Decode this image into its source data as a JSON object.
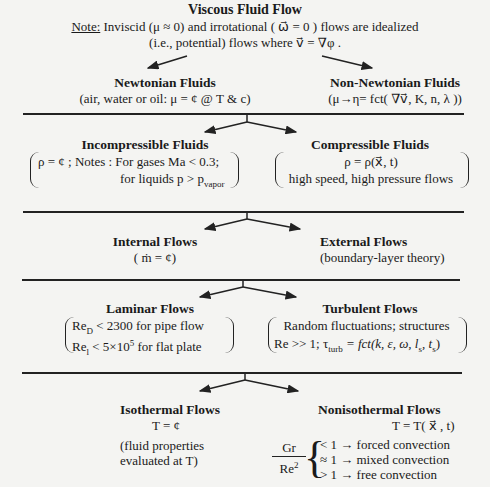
{
  "root": {
    "title": "Viscous Fluid Flow",
    "note_label": "Note:",
    "note_line1": " Inviscid (μ ≈ 0) and irrotational ( ω⃗ = 0 ) flows are idealized",
    "note_line2": "(i.e., potential) flows where  v⃗ = ∇φ ."
  },
  "level1": {
    "left": {
      "title": "Newtonian Fluids",
      "desc": "(air, water or oil: μ = ¢ @ T & c)"
    },
    "right": {
      "title": "Non-Newtonian Fluids",
      "desc": "(μ→η= fct( ∇v⃗, K, n, λ ))"
    }
  },
  "level2": {
    "left": {
      "title": "Incompressible Fluids",
      "line1": "ρ = ¢ ; Notes : For gases Ma < 0.3;",
      "line2_pre": "for liquids p > p",
      "line2_sub": "vapor"
    },
    "right": {
      "title": "Compressible Fluids",
      "line1": "ρ = ρ(x⃗, t)",
      "line2": "high speed, high pressure flows"
    }
  },
  "level3": {
    "left": {
      "title": "Internal Flows",
      "desc": "( ṁ = ¢)"
    },
    "right": {
      "title": "External Flows",
      "desc": "(boundary-layer theory)"
    }
  },
  "level4": {
    "left": {
      "title": "Laminar Flows",
      "line1_pre": "Re",
      "line1_sub": "D",
      "line1_post": " < 2300  for pipe flow",
      "line2_pre": "Re",
      "line2_sub": "l",
      "line2_mid": " < 5×10",
      "line2_sup": "5",
      "line2_post": "  for flat plate"
    },
    "right": {
      "title": "Turbulent Flows",
      "line1": "Random fluctuations; structures",
      "line2_pre": "Re >> 1; τ",
      "line2_sub": "turb",
      "line2_post": " = fct(k, ε, ω, l",
      "line2_sub2": "s",
      "line2_mid": ", t",
      "line2_sub3": "s",
      "line2_end": ")"
    }
  },
  "level5": {
    "left": {
      "title": "Isothermal Flows",
      "eq": "T = ¢",
      "desc1": "(fluid properties",
      "desc2": "evaluated at T)"
    },
    "right": {
      "title": "Nonisothermal Flows",
      "eq": "T = T( x⃗ , t)",
      "frac_num": "Gr",
      "frac_den_pre": "Re",
      "frac_den_sup": "2",
      "cases": [
        "< 1 → forced convection",
        "≈ 1 → mixed convection",
        "> 1 → free convection"
      ]
    }
  }
}
